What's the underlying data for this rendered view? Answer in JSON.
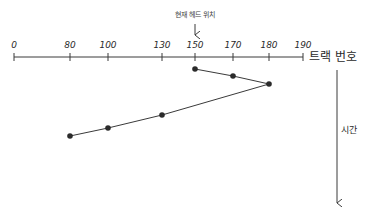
{
  "diagram": {
    "head_label": "현재 헤드 위치",
    "axis_title": "트랙 번호",
    "time_label": "시간",
    "colors": {
      "line": "#3a3a3a",
      "point": "#2b2b2b",
      "text": "#2a2a2a"
    },
    "ticks": [
      {
        "label": "0",
        "x": 14
      },
      {
        "label": "80",
        "x": 70
      },
      {
        "label": "100",
        "x": 108
      },
      {
        "label": "130",
        "x": 162
      },
      {
        "label": "150",
        "x": 195
      },
      {
        "label": "170",
        "x": 233
      },
      {
        "label": "180",
        "x": 269
      },
      {
        "label": "190",
        "x": 303
      }
    ],
    "path_points": [
      {
        "track": 150,
        "x": 195,
        "y": 69
      },
      {
        "track": 170,
        "x": 233,
        "y": 76
      },
      {
        "track": 180,
        "x": 269,
        "y": 84
      },
      {
        "track": 130,
        "x": 162,
        "y": 115
      },
      {
        "track": 100,
        "x": 108,
        "y": 128
      },
      {
        "track": 80,
        "x": 70,
        "y": 136
      }
    ]
  },
  "chart_data": {
    "type": "line",
    "title": "",
    "xlabel": "트랙 번호",
    "ylabel": "시간",
    "annotation": "현재 헤드 위치 → 150",
    "x_ticks": [
      0,
      80,
      100,
      130,
      150,
      170,
      180,
      190
    ],
    "xlim": [
      0,
      190
    ],
    "sequence": [
      150,
      170,
      180,
      130,
      100,
      80
    ]
  }
}
